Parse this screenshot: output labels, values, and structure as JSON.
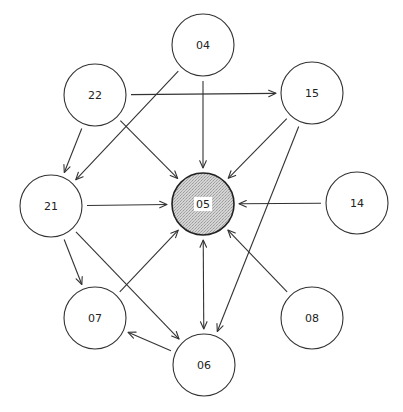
{
  "diagram": {
    "type": "directed-graph",
    "hub_node": "05",
    "colors": {
      "stroke": "#333333",
      "hub_fill": "#c8c8c8",
      "node_fill": "#ffffff",
      "background": "#ffffff"
    },
    "nodes": [
      {
        "id": "04",
        "label": "04"
      },
      {
        "id": "22",
        "label": "22"
      },
      {
        "id": "15",
        "label": "15"
      },
      {
        "id": "21",
        "label": "21"
      },
      {
        "id": "05",
        "label": "05"
      },
      {
        "id": "14",
        "label": "14"
      },
      {
        "id": "07",
        "label": "07"
      },
      {
        "id": "08",
        "label": "08"
      },
      {
        "id": "06",
        "label": "06"
      }
    ],
    "edges": [
      {
        "from": "22",
        "to": "15",
        "bidirectional": false
      },
      {
        "from": "22",
        "to": "21",
        "bidirectional": false
      },
      {
        "from": "22",
        "to": "05",
        "bidirectional": false
      },
      {
        "from": "04",
        "to": "21",
        "bidirectional": false
      },
      {
        "from": "04",
        "to": "05",
        "bidirectional": false
      },
      {
        "from": "15",
        "to": "05",
        "bidirectional": false
      },
      {
        "from": "15",
        "to": "06",
        "bidirectional": false
      },
      {
        "from": "21",
        "to": "05",
        "bidirectional": false
      },
      {
        "from": "21",
        "to": "07",
        "bidirectional": false
      },
      {
        "from": "21",
        "to": "06",
        "bidirectional": false
      },
      {
        "from": "14",
        "to": "05",
        "bidirectional": false
      },
      {
        "from": "07",
        "to": "05",
        "bidirectional": false
      },
      {
        "from": "08",
        "to": "05",
        "bidirectional": false
      },
      {
        "from": "05",
        "to": "06",
        "bidirectional": true
      },
      {
        "from": "06",
        "to": "07",
        "bidirectional": false
      }
    ]
  }
}
